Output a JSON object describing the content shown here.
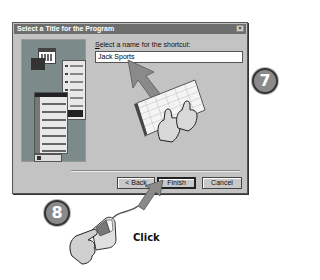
{
  "dialog": {
    "title": "Select a Title for the Program",
    "close_glyph": "×",
    "prompt_prefix": "S",
    "prompt_rest": "elect a name for the shortcut:",
    "name_value": "Jack Sports",
    "buttons": {
      "back": "< Back",
      "finish": "Finish",
      "cancel": "Cancel"
    }
  },
  "steps": {
    "step7": "7",
    "step8": "8",
    "click_label": "Click"
  },
  "colors": {
    "dialog_bg": "#c3c3c3",
    "titlebar": "#6e6e6e",
    "left_panel": "#7d8a8a",
    "arrow": "#8a8a8a",
    "badge": "#8a8a8a"
  },
  "icons": [
    "close-icon",
    "calendar-icon",
    "keyboard-icon",
    "hand-icon",
    "mouse-icon",
    "arrow-icon"
  ]
}
